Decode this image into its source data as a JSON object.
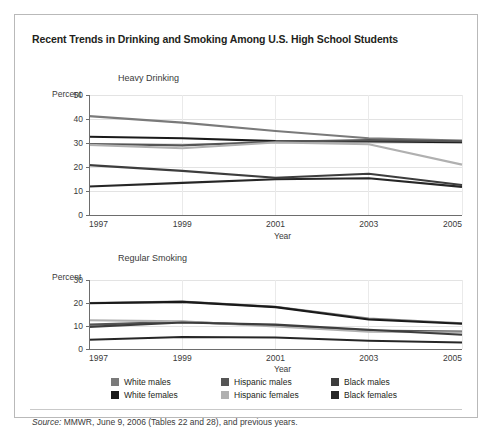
{
  "figure": {
    "title": "Recent Trends in Drinking and Smoking Among U.S. High School Students",
    "source_prefix": "Source:",
    "source_text": " MMWR, June 9, 2006 (Tables 22 and 28), and previous years."
  },
  "legend": {
    "rows": [
      [
        {
          "label": "White males",
          "color": "#7a7a7a"
        },
        {
          "label": "Hispanic males",
          "color": "#555555"
        },
        {
          "label": "Black males",
          "color": "#3d3d3d"
        }
      ],
      [
        {
          "label": "White females",
          "color": "#1a1a1a"
        },
        {
          "label": "Hispanic females",
          "color": "#b0b0b0"
        },
        {
          "label": "Black females",
          "color": "#262626"
        }
      ]
    ]
  },
  "chart_data": [
    {
      "type": "line",
      "title": "Heavy Drinking",
      "xlabel": "Year",
      "ylabel": "Percent",
      "x": [
        1997,
        1999,
        2001,
        2003,
        2005
      ],
      "xticklabels": [
        "1997",
        "1999",
        "2001",
        "2003",
        "2005"
      ],
      "yticks": [
        0,
        10,
        20,
        30,
        40,
        50
      ],
      "yticklabels": [
        "0",
        "10",
        "20",
        "30",
        "40",
        "50"
      ],
      "ylim": [
        0,
        50
      ],
      "xlim": [
        1997,
        2005
      ],
      "grid": true,
      "legend_position": "below",
      "series": [
        {
          "name": "White males",
          "color": "#7a7a7a",
          "values": [
            41.2,
            38.5,
            35.0,
            32.0,
            31.0
          ]
        },
        {
          "name": "White females",
          "color": "#1a1a1a",
          "values": [
            32.6,
            32.0,
            30.8,
            30.6,
            30.3
          ]
        },
        {
          "name": "Hispanic males",
          "color": "#555555",
          "values": [
            29.6,
            29.0,
            30.5,
            31.2,
            30.7
          ]
        },
        {
          "name": "Hispanic females",
          "color": "#b0b0b0",
          "values": [
            29.2,
            27.8,
            30.2,
            29.5,
            21.0
          ]
        },
        {
          "name": "Black males",
          "color": "#3d3d3d",
          "values": [
            20.8,
            18.4,
            15.5,
            17.2,
            12.5
          ]
        },
        {
          "name": "Black females",
          "color": "#262626",
          "values": [
            11.9,
            13.4,
            14.9,
            15.3,
            11.7
          ]
        }
      ]
    },
    {
      "type": "line",
      "title": "Regular Smoking",
      "xlabel": "Year",
      "ylabel": "Percent",
      "x": [
        1997,
        1999,
        2001,
        2003,
        2005
      ],
      "xticklabels": [
        "1997",
        "1999",
        "2001",
        "2003",
        "2005"
      ],
      "yticks": [
        0,
        10,
        20,
        30
      ],
      "yticklabels": [
        "0",
        "10",
        "20",
        "30"
      ],
      "ylim": [
        0,
        30
      ],
      "xlim": [
        1997,
        2005
      ],
      "grid": true,
      "legend_position": "below",
      "series": [
        {
          "name": "White males",
          "color": "#7a7a7a",
          "values": [
            20.0,
            20.6,
            18.4,
            13.2,
            11.2
          ]
        },
        {
          "name": "White females",
          "color": "#1a1a1a",
          "values": [
            19.9,
            20.5,
            18.2,
            12.8,
            11.0
          ]
        },
        {
          "name": "Hispanic males",
          "color": "#555555",
          "values": [
            10.6,
            11.8,
            10.2,
            8.0,
            7.6
          ]
        },
        {
          "name": "Hispanic females",
          "color": "#b0b0b0",
          "values": [
            12.5,
            12.0,
            9.8,
            7.5,
            7.2
          ]
        },
        {
          "name": "Black males",
          "color": "#3d3d3d",
          "values": [
            9.6,
            11.5,
            10.6,
            8.4,
            6.2
          ]
        },
        {
          "name": "Black females",
          "color": "#262626",
          "values": [
            4.0,
            5.2,
            5.0,
            3.6,
            2.8
          ]
        }
      ]
    }
  ]
}
